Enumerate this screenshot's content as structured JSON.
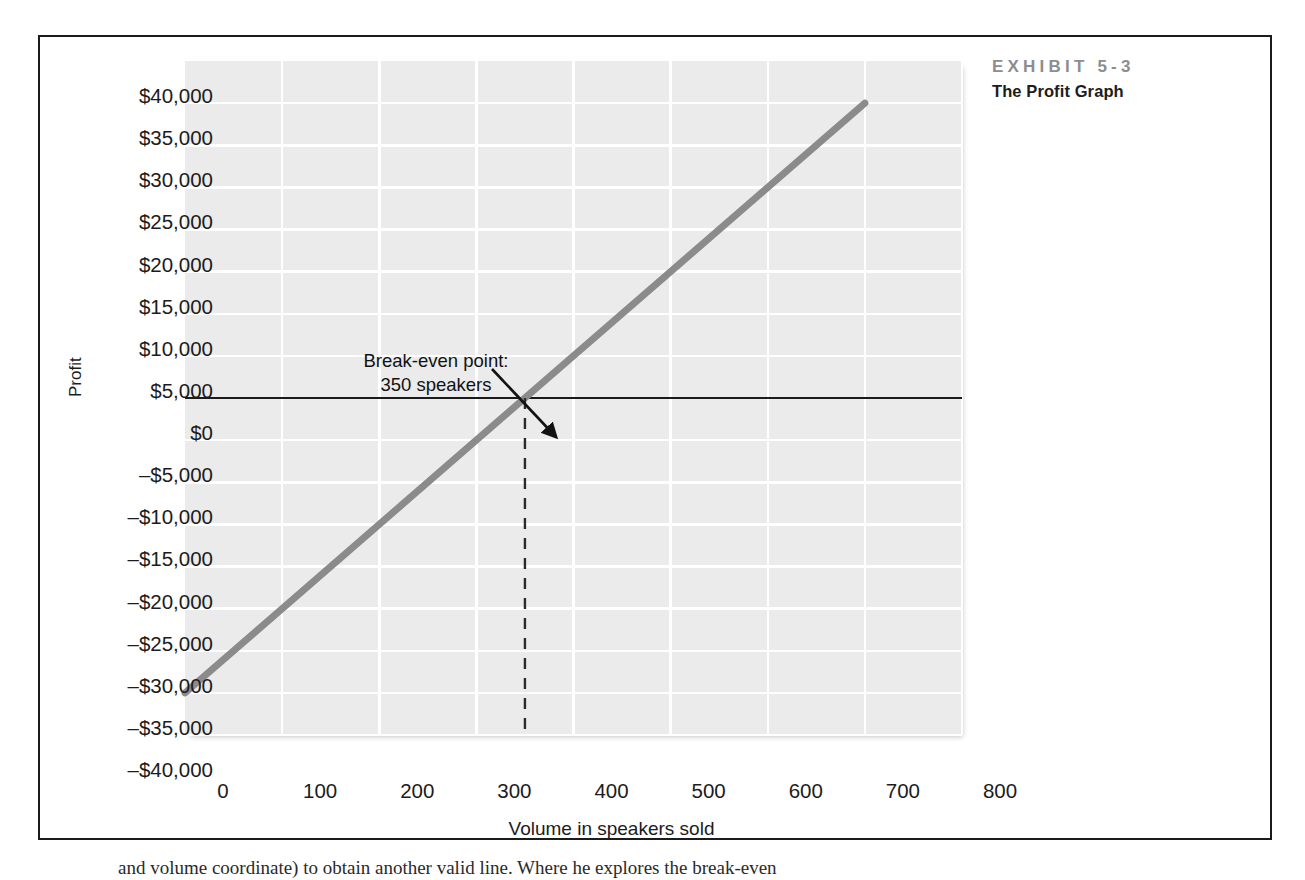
{
  "exhibit": {
    "number": "EXHIBIT 5-3",
    "title": "The Profit Graph"
  },
  "colors": {
    "plot_background": "#ebebeb",
    "gridline": "#ffffff",
    "profit_line": "#8b8b8b",
    "zero_line": "#1b1b1b",
    "frame": "#1b1b1b",
    "exhibit_number_text": "#8b8d8f",
    "tick_text": "#1c1c1c"
  },
  "annotation": {
    "line1": "Break-even point:",
    "line2": "350 speakers"
  },
  "body_text": {
    "fragment": "and volume coordinate) to obtain another valid line. Where he explores the break-even"
  },
  "chart_data": {
    "type": "line",
    "title": "The Profit Graph",
    "xlabel": "Volume in speakers sold",
    "ylabel": "Profit",
    "xlim": [
      0,
      800
    ],
    "ylim": [
      -40000,
      40000
    ],
    "x_ticks": [
      0,
      100,
      200,
      300,
      400,
      500,
      600,
      700,
      800
    ],
    "x_tick_labels": [
      "0",
      "100",
      "200",
      "300",
      "400",
      "500",
      "600",
      "700",
      "800"
    ],
    "y_ticks": [
      40000,
      35000,
      30000,
      25000,
      20000,
      15000,
      10000,
      5000,
      0,
      -5000,
      -10000,
      -15000,
      -20000,
      -25000,
      -30000,
      -35000,
      -40000
    ],
    "y_tick_labels": [
      "$40,000",
      "$35,000",
      "$30,000",
      "$25,000",
      "$20,000",
      "$15,000",
      "$10,000",
      "$5,000",
      "$0",
      "–$5,000",
      "–$10,000",
      "–$15,000",
      "–$20,000",
      "–$25,000",
      "–$30,000",
      "–$35,000",
      "–$40,000"
    ],
    "grid": true,
    "legend": false,
    "series": [
      {
        "name": "Profit",
        "x": [
          0,
          700
        ],
        "values": [
          -35000,
          35000
        ],
        "fixed_expenses": 35000,
        "contribution_margin_per_unit": 100
      }
    ],
    "reference_lines": [
      {
        "name": "zero-profit-line",
        "orientation": "horizontal",
        "value": 0,
        "style": "solid"
      },
      {
        "name": "break-even-volume-line",
        "orientation": "vertical",
        "value": 350,
        "style": "dashed",
        "from": 0,
        "to": -40000
      }
    ],
    "annotations": [
      {
        "text": "Break-even point: 350 speakers",
        "point_x": 350,
        "point_y": 0
      }
    ]
  }
}
